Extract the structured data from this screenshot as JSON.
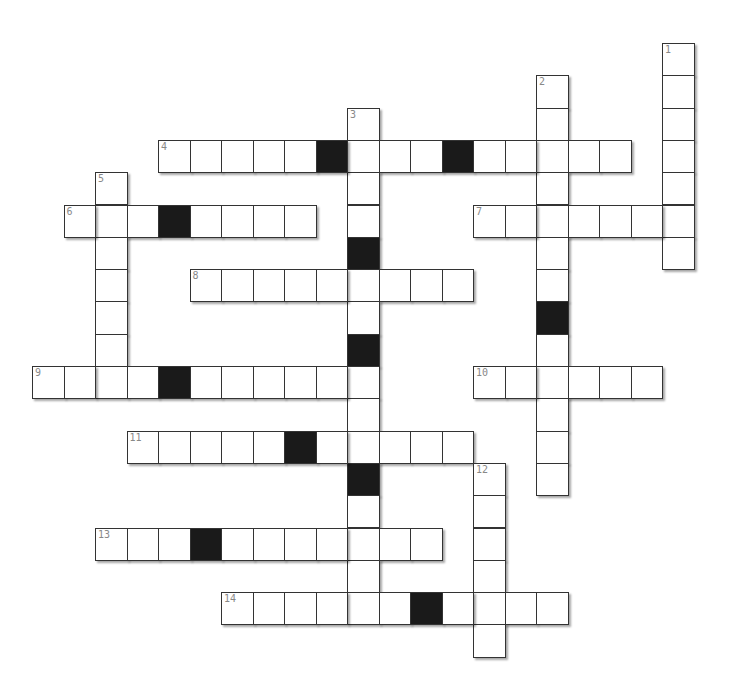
{
  "puzzle": {
    "type": "crossword",
    "origin_x": 32,
    "origin_y": 43,
    "pitch_x": 31.5,
    "pitch_y": 32.3,
    "colors": {
      "cell": "#ffffff",
      "block": "#1a1a1a",
      "border": "#333333",
      "number": "#888888"
    }
  },
  "words": [
    {
      "number": "1",
      "dir": "down",
      "row": 0,
      "col": 20,
      "length": 7,
      "blocks": []
    },
    {
      "number": "2",
      "dir": "down",
      "row": 1,
      "col": 16,
      "length": 13,
      "blocks": [
        8
      ]
    },
    {
      "number": "3",
      "dir": "down",
      "row": 2,
      "col": 10,
      "length": 16,
      "blocks": [
        6,
        9,
        13
      ]
    },
    {
      "number": "4",
      "dir": "across",
      "row": 3,
      "col": 4,
      "length": 15,
      "blocks": [
        9,
        13
      ]
    },
    {
      "number": "5",
      "dir": "down",
      "row": 4,
      "col": 2,
      "length": 7,
      "blocks": []
    },
    {
      "number": "6",
      "dir": "across",
      "row": 5,
      "col": 1,
      "length": 8,
      "blocks": [
        4
      ]
    },
    {
      "number": "7",
      "dir": "across",
      "row": 5,
      "col": 14,
      "length": 7,
      "blocks": []
    },
    {
      "number": "8",
      "dir": "across",
      "row": 7,
      "col": 5,
      "length": 9,
      "blocks": []
    },
    {
      "number": "9",
      "dir": "across",
      "row": 10,
      "col": 0,
      "length": 11,
      "blocks": [
        4
      ]
    },
    {
      "number": "10",
      "dir": "across",
      "row": 10,
      "col": 14,
      "length": 6,
      "blocks": []
    },
    {
      "number": "11",
      "dir": "across",
      "row": 12,
      "col": 3,
      "length": 11,
      "blocks": [
        8
      ]
    },
    {
      "number": "12",
      "dir": "down",
      "row": 13,
      "col": 14,
      "length": 6,
      "blocks": []
    },
    {
      "number": "13",
      "dir": "across",
      "row": 15,
      "col": 2,
      "length": 11,
      "blocks": [
        5
      ]
    },
    {
      "number": "14",
      "dir": "across",
      "row": 17,
      "col": 6,
      "length": 11,
      "blocks": [
        12
      ]
    }
  ]
}
